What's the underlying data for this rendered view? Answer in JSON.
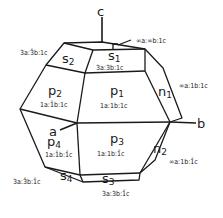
{
  "diagram": {
    "type": "crystal-form",
    "axes": {
      "a": "a",
      "b": "b",
      "c": "c"
    },
    "faces": [
      {
        "id": "s1",
        "label": "s",
        "sub": "1",
        "index": "3a:3b:1c"
      },
      {
        "id": "s2",
        "label": "s",
        "sub": "2",
        "index": "3a:3̄b:1c"
      },
      {
        "id": "p1",
        "label": "p",
        "sub": "1",
        "index": "1a:1b:1c"
      },
      {
        "id": "p2",
        "label": "p",
        "sub": "2",
        "index": "1a:1̄b:1c"
      },
      {
        "id": "p3",
        "label": "p",
        "sub": "3",
        "index": "1a:1b:1̄c"
      },
      {
        "id": "p4",
        "label": "p",
        "sub": "4",
        "index": "1a:1̄b:1̄c"
      },
      {
        "id": "n1",
        "label": "n",
        "sub": "1",
        "index": "∞a:1b:1c"
      },
      {
        "id": "n2",
        "label": "n",
        "sub": "2",
        "index": "∞a:1b:1̄c"
      },
      {
        "id": "s3",
        "label": "s",
        "sub": "3",
        "index": "3a:3b:1̄c"
      },
      {
        "id": "s4",
        "label": "s",
        "sub": "4",
        "index": "3a:3̄b:1̄c"
      }
    ],
    "top_face_index": "∞a:∞b:1c"
  }
}
